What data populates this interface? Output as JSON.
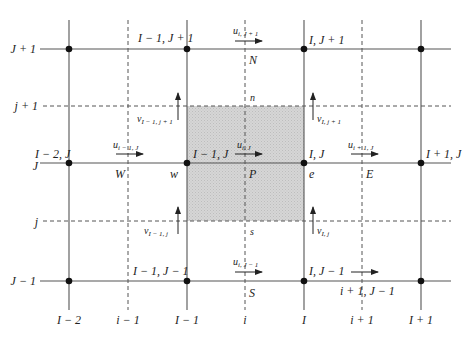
{
  "diagram": {
    "colors": {
      "background": "#ffffff",
      "line": "#555555",
      "node": "#111111",
      "shaded_cell": "#d3d3d3",
      "text": "#222222"
    },
    "axes": {
      "row_labels_left": [
        {
          "id": "J+1",
          "text": "J + 1",
          "y": 49
        },
        {
          "id": "j+1",
          "text": "j + 1",
          "y": 106
        },
        {
          "id": "J",
          "text": "J",
          "y": 166
        },
        {
          "id": "j",
          "text": "j",
          "y": 221
        },
        {
          "id": "J-1",
          "text": "J − 1",
          "y": 281
        }
      ],
      "column_labels_bottom": [
        {
          "id": "I-2",
          "text": "I − 2",
          "x": 69
        },
        {
          "id": "i-1",
          "text": "i − 1",
          "x": 128
        },
        {
          "id": "I-1",
          "text": "I − 1",
          "x": 187
        },
        {
          "id": "i",
          "text": "i",
          "x": 245
        },
        {
          "id": "I",
          "text": "I",
          "x": 304
        },
        {
          "id": "i+1",
          "text": "i + 1",
          "x": 362
        },
        {
          "id": "I+1",
          "text": "I + 1",
          "x": 421
        }
      ]
    },
    "node_labels": {
      "I-1_J+1": "I − 1, J + 1",
      "I_J+1": "I, J + 1",
      "I-2_J": "I − 2, J",
      "I-1_J": "I − 1, J",
      "I_J": "I, J",
      "I+1_J": "I + 1, J",
      "I-1_J-1": "I − 1, J − 1",
      "I_J-1": "I, J − 1",
      "i+1_J-1": "i + 1, J − 1"
    },
    "point_labels": {
      "N": "N",
      "n": "n",
      "W": "W",
      "w": "w",
      "P": "P",
      "e": "e",
      "E": "E",
      "s": "s",
      "S": "S"
    },
    "velocity_labels": {
      "u_i_J+1": {
        "base": "u",
        "sub": "i, J + 1"
      },
      "u_i-1_J": {
        "base": "u",
        "sub": "i − 1, J"
      },
      "u_i_J": {
        "base": "u",
        "sub": "i, J"
      },
      "u_i+1_J": {
        "base": "u",
        "sub": "i + 1, J"
      },
      "u_i_J-1": {
        "base": "u",
        "sub": "i, J − 1"
      },
      "v_I-1_j+1": {
        "base": "v",
        "sub": "I − 1, j + 1"
      },
      "v_I_j+1": {
        "base": "v",
        "sub": "I, j + 1"
      },
      "v_I-1_j": {
        "base": "v",
        "sub": "I − 1, j"
      },
      "v_I_j": {
        "base": "v",
        "sub": "I, j"
      }
    }
  }
}
